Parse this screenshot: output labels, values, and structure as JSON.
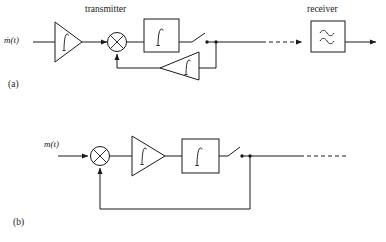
{
  "figure": {
    "type": "block-diagram",
    "background": "#ffffff",
    "line_color": "#1a1a1a",
    "panels": [
      {
        "id": "a",
        "caption": "(a)",
        "section_labels": [
          {
            "name": "transmitter-label",
            "text": "transmitter"
          },
          {
            "name": "receiver-label",
            "text": "receiver"
          }
        ],
        "input_signal_label": "ṁ(t)",
        "blocks": [
          {
            "name": "input-amplifier",
            "shape": "triangle-right",
            "symbol": "∫"
          },
          {
            "name": "mixer",
            "shape": "circle-x",
            "symbol": "⊗"
          },
          {
            "name": "integrator",
            "shape": "rectangle",
            "symbol": "∫"
          },
          {
            "name": "sampling-switch",
            "shape": "switch-open",
            "symbol": ""
          },
          {
            "name": "feedback-amplifier",
            "shape": "triangle-left",
            "symbol": "∫"
          },
          {
            "name": "receiver-filter",
            "shape": "rectangle",
            "symbol": "≈"
          }
        ],
        "channel": {
          "name": "transmission-channel",
          "style": "dashed"
        }
      },
      {
        "id": "b",
        "caption": "(b)",
        "section_labels": [],
        "input_signal_label": "m(t)",
        "blocks": [
          {
            "name": "summing-mixer",
            "shape": "circle-x",
            "symbol": "⊗"
          },
          {
            "name": "amplifier",
            "shape": "triangle-right",
            "symbol": "∫"
          },
          {
            "name": "integrator",
            "shape": "rectangle",
            "symbol": "∫"
          },
          {
            "name": "sampling-switch",
            "shape": "switch-open",
            "symbol": ""
          }
        ],
        "feedback": {
          "name": "feedback-path",
          "style": "solid"
        },
        "channel": {
          "name": "output-channel",
          "style": "dashed"
        }
      }
    ]
  }
}
